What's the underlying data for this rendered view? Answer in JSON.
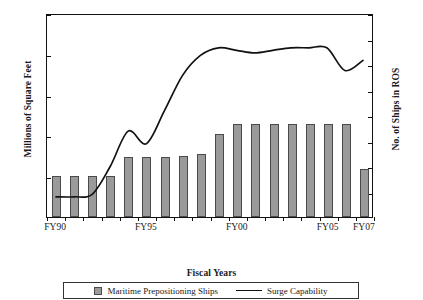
{
  "chart_data": {
    "type": "bar",
    "title": "",
    "xlabel": "Fiscal Years",
    "ylabel": "Millions of Square Feet",
    "ylabel_secondary": "No. of Ships in ROS",
    "ylim": [
      0,
      10
    ],
    "ylim_secondary": [
      0,
      80
    ],
    "grid": false,
    "legend_position": "bottom",
    "categories": [
      "FY90",
      "FY91",
      "FY92",
      "FY93",
      "FY94",
      "FY95",
      "FY96",
      "FY97",
      "FY98",
      "FY99",
      "FY00",
      "FY01",
      "FY02",
      "FY03",
      "FY04",
      "FY05",
      "FY06",
      "FY07"
    ],
    "xtick_labels": [
      "FY90",
      "FY95",
      "FY00",
      "FY05",
      "FY07"
    ],
    "xtick_categories": [
      "FY90",
      "FY95",
      "FY00",
      "FY05",
      "FY07"
    ],
    "ytick_labels": [
      "2",
      "4",
      "6",
      "8",
      "10"
    ],
    "ytick_values": [
      2,
      4,
      6,
      8,
      10
    ],
    "ytick_labels_secondary": [
      "10",
      "20",
      "30",
      "40",
      "50",
      "60",
      "70",
      "80"
    ],
    "ytick_values_secondary": [
      10,
      20,
      30,
      40,
      50,
      60,
      70,
      80
    ],
    "series": [
      {
        "name": "Maritime Prepositioning Ships",
        "type": "bar",
        "axis": "left",
        "color": "#9a9a9a",
        "values": [
          2.0,
          2.0,
          2.0,
          2.0,
          2.95,
          2.95,
          2.95,
          2.97,
          3.1,
          4.05,
          4.55,
          4.55,
          4.55,
          4.55,
          4.55,
          4.55,
          4.55,
          2.35
        ]
      },
      {
        "name": "Surge Capability",
        "type": "line",
        "axis": "right",
        "color": "#111111",
        "values": [
          8,
          8,
          9,
          20,
          34,
          29,
          42,
          56,
          64,
          67,
          66,
          65,
          66,
          67,
          67,
          67,
          58,
          62
        ]
      }
    ]
  },
  "legend": {
    "bars_label": "Maritime Prepositioning Ships",
    "line_label": "Surge Capability"
  },
  "axes": {
    "x_title": "Fiscal Years",
    "y_left_title": "Millions of Square Feet",
    "y_right_title": "No. of Ships in ROS"
  }
}
